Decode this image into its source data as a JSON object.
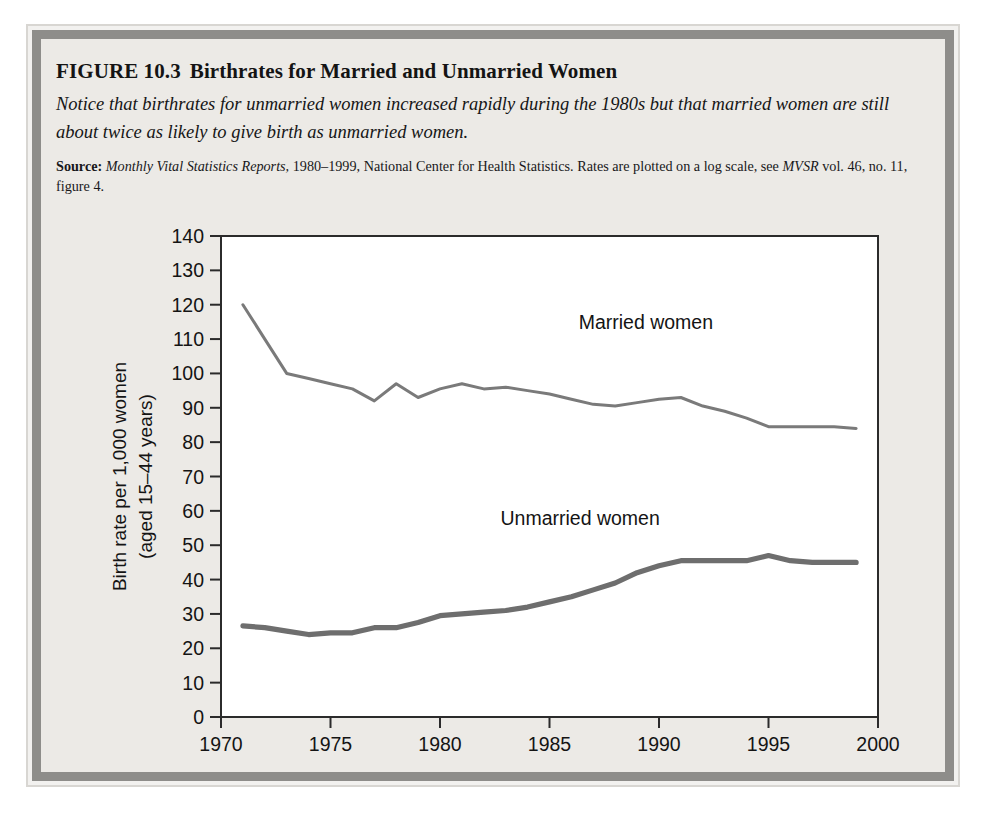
{
  "figure": {
    "number": "FIGURE 10.3",
    "title": "Birthrates for Married and Unmarried Women",
    "subtitle": "Notice that birthrates for unmarried women increased rapidly during the 1980s but that married women are still about twice as likely to give birth as unmarried women.",
    "source_label": "Source:",
    "source_italic_1": "Monthly Vital Statistics Reports,",
    "source_rest_1": " 1980–1999, National Center for Health Statistics. Rates are plotted on a log scale, see ",
    "source_italic_2": "MVSR",
    "source_rest_2": " vol. 46, no. 11, figure 4."
  },
  "colors": {
    "married_line": "#7a7a7a",
    "unmarried_line": "#6e6e6e",
    "axis": "#2b2b2b",
    "panel_background": "#eceae6",
    "plot_background": "#ffffff",
    "frame_gray": "#8e8d8a",
    "text": "#141414"
  },
  "chart_data": {
    "type": "line",
    "title": "Birthrates for Married and Unmarried Women",
    "xlabel": "",
    "ylabel": "Birth rate per 1,000 women (aged 15–44 years)",
    "ylabel_line1": "Birth rate per 1,000 women",
    "ylabel_line2": "(aged 15–44 years)",
    "xlim": [
      1970,
      2000
    ],
    "ylim": [
      0,
      140
    ],
    "xticks": [
      1970,
      1975,
      1980,
      1985,
      1990,
      1995,
      2000
    ],
    "xticklabels": [
      "1970",
      "1975",
      "1980",
      "1985",
      "1990",
      "1995",
      "2000"
    ],
    "yticks": [
      0,
      10,
      20,
      30,
      40,
      50,
      60,
      70,
      80,
      90,
      100,
      110,
      120,
      130,
      140
    ],
    "yticklabels": [
      "0",
      "10",
      "20",
      "30",
      "40",
      "50",
      "60",
      "70",
      "80",
      "90",
      "100",
      "110",
      "120",
      "130",
      "140"
    ],
    "grid": false,
    "legend_position": "inline-annotations",
    "annotations": [
      {
        "text": "Married women",
        "x": 1989.4,
        "y": 113
      },
      {
        "text": "Unmarried women",
        "x": 1986.4,
        "y": 56
      }
    ],
    "x": [
      1971,
      1972,
      1973,
      1974,
      1975,
      1976,
      1977,
      1978,
      1979,
      1980,
      1981,
      1982,
      1983,
      1984,
      1985,
      1986,
      1987,
      1988,
      1989,
      1990,
      1991,
      1992,
      1993,
      1994,
      1995,
      1996,
      1997,
      1998,
      1999
    ],
    "series": [
      {
        "name": "Married women",
        "color": "#7a7a7a",
        "values": [
          120.0,
          110.0,
          100.0,
          98.5,
          97.0,
          95.5,
          92.0,
          97.0,
          93.0,
          95.5,
          97.0,
          95.5,
          96.0,
          95.0,
          94.0,
          92.5,
          91.0,
          90.5,
          91.5,
          92.5,
          93.0,
          90.5,
          89.0,
          87.0,
          84.5,
          84.5,
          84.5,
          84.5,
          84.0
        ]
      },
      {
        "name": "Unmarried women",
        "color": "#6e6e6e",
        "values": [
          26.5,
          26.0,
          25.0,
          24.0,
          24.5,
          24.5,
          26.0,
          26.0,
          27.5,
          29.5,
          30.0,
          30.5,
          31.0,
          32.0,
          33.5,
          35.0,
          37.0,
          39.0,
          42.0,
          44.0,
          45.5,
          45.5,
          45.5,
          45.5,
          47.0,
          45.5,
          45.0,
          45.0,
          45.0
        ]
      }
    ]
  }
}
